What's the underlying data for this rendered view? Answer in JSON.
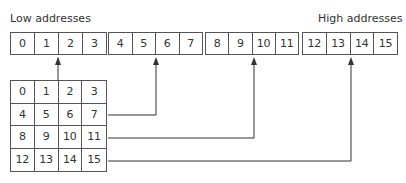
{
  "labels": {
    "low": "Low addresses",
    "high": "High addresses"
  },
  "linear_memory": {
    "groups": [
      {
        "cells": [
          "0",
          "1",
          "2",
          "3"
        ]
      },
      {
        "cells": [
          "4",
          "5",
          "6",
          "7"
        ]
      },
      {
        "cells": [
          "8",
          "9",
          "10",
          "11"
        ]
      },
      {
        "cells": [
          "12",
          "13",
          "14",
          "15"
        ]
      }
    ]
  },
  "matrix": {
    "rows": [
      [
        "0",
        "1",
        "2",
        "3"
      ],
      [
        "4",
        "5",
        "6",
        "7"
      ],
      [
        "8",
        "9",
        "10",
        "11"
      ],
      [
        "12",
        "13",
        "14",
        "15"
      ]
    ]
  },
  "arrows": [
    {
      "from_row": 0,
      "to_cell": "2"
    },
    {
      "from_row": 1,
      "to_cell": "6"
    },
    {
      "from_row": 2,
      "to_cell": "10"
    },
    {
      "from_row": 3,
      "to_cell": "14"
    }
  ],
  "colors": {
    "line": "#333333",
    "border": "#555555",
    "text": "#333333"
  }
}
